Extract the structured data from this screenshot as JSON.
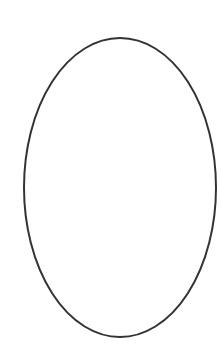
{
  "canvas": {
    "width": 221,
    "height": 350,
    "background": "#ffffff"
  },
  "shape": {
    "type": "ellipse",
    "cx": 120,
    "cy": 187.5,
    "rx": 96,
    "ry": 149.5,
    "stroke": "#333333",
    "stroke_width": 2,
    "fill": "none"
  }
}
